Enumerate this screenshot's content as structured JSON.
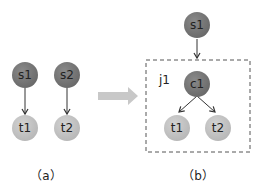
{
  "colors": {
    "source_node": "#7a7a7a",
    "target_node": "#c4c4c4",
    "edge": "#333333",
    "transform_arrow": "#c8c8c8",
    "group_border": "#555555"
  },
  "panel_a": {
    "caption": "（a）",
    "nodes": [
      {
        "id": "s1",
        "label": "s1",
        "kind": "source"
      },
      {
        "id": "s2",
        "label": "s2",
        "kind": "source"
      },
      {
        "id": "t1",
        "label": "t1",
        "kind": "target"
      },
      {
        "id": "t2",
        "label": "t2",
        "kind": "target"
      }
    ],
    "edges": [
      {
        "from": "s1",
        "to": "t1"
      },
      {
        "from": "s2",
        "to": "t2"
      }
    ]
  },
  "panel_b": {
    "caption": "（b）",
    "group_label": "j1",
    "nodes": [
      {
        "id": "s1",
        "label": "s1",
        "kind": "source"
      },
      {
        "id": "c1",
        "label": "c1",
        "kind": "source"
      },
      {
        "id": "t1",
        "label": "t1",
        "kind": "target"
      },
      {
        "id": "t2",
        "label": "t2",
        "kind": "target"
      }
    ],
    "edges": [
      {
        "from": "s1",
        "to": "j1"
      },
      {
        "from": "c1",
        "to": "t1"
      },
      {
        "from": "c1",
        "to": "t2"
      }
    ]
  }
}
